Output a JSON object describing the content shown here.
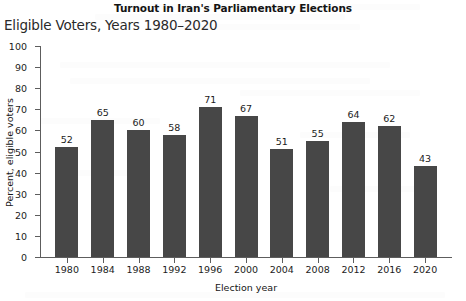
{
  "title": "Turnout in Iran's Parliamentary Elections",
  "subtitle": "Eligible Voters, Years 1980–2020",
  "axis_title_x": "Election year",
  "axis_title_y": "Percent, eligible voters",
  "colors": {
    "bar": "#474747",
    "axis": "#5d5d5d",
    "text": "#1c1c1c",
    "background": "#ffffff"
  },
  "chart_data": {
    "type": "bar",
    "title": "Turnout in Iran's Parliamentary Elections",
    "subtitle": "Eligible Voters, Years 1980–2020",
    "xlabel": "Election year",
    "ylabel": "Percent, eligible voters",
    "ylim": [
      0,
      100
    ],
    "ytick_step": 10,
    "yticks": [
      0,
      10,
      20,
      30,
      40,
      50,
      60,
      70,
      80,
      90,
      100
    ],
    "grid": false,
    "legend": false,
    "categories": [
      "1980",
      "1984",
      "1988",
      "1992",
      "1996",
      "2000",
      "2004",
      "2008",
      "2012",
      "2016",
      "2020"
    ],
    "values": [
      52,
      65,
      60,
      58,
      71,
      67,
      51,
      55,
      64,
      62,
      43
    ],
    "data_labels": [
      "52",
      "65",
      "60",
      "58",
      "71",
      "67",
      "51",
      "55",
      "64",
      "62",
      "43"
    ]
  }
}
